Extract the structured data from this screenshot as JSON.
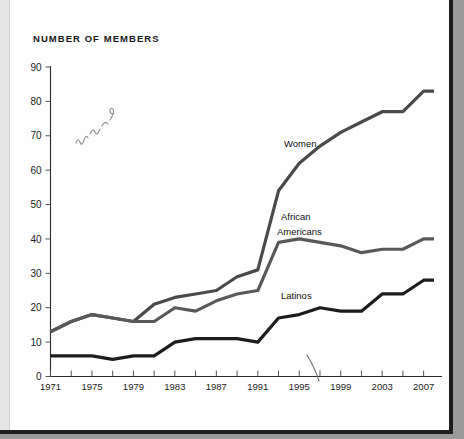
{
  "page": {
    "title": "NUMBER OF MEMBERS",
    "background_color": "#ffffff",
    "margin_color": "#9a9a9a"
  },
  "annotations": {
    "handwriting_note": "handwritten scribble in upper-left plot area",
    "pen_mark_note": "thin curved pen stroke above the 1999 tick"
  },
  "chart_data": {
    "type": "line",
    "title": "NUMBER OF MEMBERS",
    "xlabel": "",
    "ylabel": "",
    "xlim": [
      1971,
      2008
    ],
    "ylim": [
      0,
      90
    ],
    "ytick_step": 10,
    "yticks": [
      0,
      10,
      20,
      30,
      40,
      50,
      60,
      70,
      80,
      90
    ],
    "xticks": [
      1971,
      1973,
      1975,
      1977,
      1979,
      1981,
      1983,
      1985,
      1987,
      1989,
      1991,
      1993,
      1995,
      1997,
      1999,
      2001,
      2003,
      2005,
      2007
    ],
    "xtick_labels": [
      "1971",
      "",
      "1975",
      "",
      "1979",
      "",
      "1983",
      "",
      "1987",
      "",
      "1991",
      "",
      "1995",
      "",
      "1999",
      "",
      "2003",
      "",
      "2007"
    ],
    "xtick_labels_shown": [
      "1971",
      "1975",
      "1979",
      "1983",
      "1987",
      "1991",
      "1995",
      "1999",
      "2003",
      "2007"
    ],
    "grid": false,
    "legend_position": "inline-labels",
    "x": [
      1971,
      1973,
      1975,
      1977,
      1979,
      1981,
      1983,
      1985,
      1987,
      1989,
      1991,
      1993,
      1995,
      1997,
      1999,
      2001,
      2003,
      2005,
      2007,
      2008
    ],
    "series": [
      {
        "name": "Women",
        "color": "#4a4a4a",
        "stroke_width": 3.2,
        "label": "Women",
        "values": [
          13,
          16,
          18,
          17,
          16,
          21,
          23,
          24,
          25,
          29,
          31,
          54,
          62,
          67,
          71,
          74,
          77,
          77,
          83,
          83
        ]
      },
      {
        "name": "African Americans",
        "color": "#595959",
        "stroke_width": 3.2,
        "label": "African\nAmericans",
        "label_line1": "African",
        "label_line2": "Americans",
        "values": [
          13,
          16,
          18,
          17,
          16,
          16,
          20,
          19,
          22,
          24,
          25,
          39,
          40,
          39,
          38,
          36,
          37,
          37,
          40,
          40
        ]
      },
      {
        "name": "Latinos",
        "color": "#1d1d1d",
        "stroke_width": 3.2,
        "label": "Latinos",
        "values": [
          6,
          6,
          6,
          5,
          6,
          6,
          10,
          11,
          11,
          11,
          10,
          17,
          18,
          20,
          19,
          19,
          24,
          24,
          28,
          28
        ]
      }
    ]
  }
}
